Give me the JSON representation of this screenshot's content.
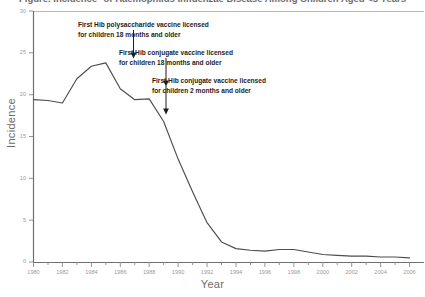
{
  "chart_data": {
    "type": "line",
    "title": "Figure. Incidence* of Haemophilus influenzae Disease Among Children Aged <5 Years",
    "xlabel": "Year",
    "ylabel": "Incidence",
    "xlim": [
      1980,
      2007
    ],
    "ylim": [
      0,
      30
    ],
    "grid": false,
    "legend": "none",
    "xticks": [
      1980,
      1982,
      1984,
      1986,
      1988,
      1990,
      1992,
      1994,
      1996,
      1998,
      2000,
      2002,
      2004,
      2006
    ],
    "xtick_labels": [
      "1980",
      "1982",
      "1984",
      "1986",
      "1988",
      "1990",
      "1992",
      "1994",
      "1996",
      "1998",
      "2000",
      "2002",
      "2004",
      "2006"
    ],
    "yticks": [
      0,
      5,
      10,
      15,
      20,
      25,
      30
    ],
    "ytick_labels": [
      "0",
      "5",
      "10",
      "15",
      "20",
      "25",
      "30"
    ],
    "x": [
      1980,
      1981,
      1982,
      1983,
      1984,
      1985,
      1986,
      1987,
      1988,
      1989,
      1990,
      1991,
      1992,
      1993,
      1994,
      1995,
      1996,
      1997,
      1998,
      1999,
      2000,
      2001,
      2002,
      2003,
      2004,
      2005,
      2006
    ],
    "values": [
      19.4,
      19.3,
      19.0,
      21.9,
      23.4,
      23.8,
      20.7,
      19.4,
      19.5,
      16.8,
      12.3,
      8.4,
      4.7,
      2.4,
      1.6,
      1.4,
      1.3,
      1.5,
      1.5,
      1.2,
      0.9,
      0.8,
      0.7,
      0.7,
      0.6,
      0.6,
      0.5
    ],
    "series_name": "Haemophilus influenzae incidence",
    "annotations": [
      {
        "id": "annotation-1",
        "lines": [
          "First Hib polysaccharide vaccine licensed",
          "for children 18 months and older"
        ],
        "arrow_year": 1985
      },
      {
        "id": "annotation-2",
        "lines": [
          "First Hib conjugate vaccine licensed",
          "for children 18 months and older"
        ],
        "arrow_year": 1987
      },
      {
        "id": "annotation-3",
        "lines": [
          "First Hib conjugate vaccine licensed",
          "for children 2 months and older"
        ],
        "arrow_year": 1989
      }
    ],
    "colors": {
      "line": "#4d4d4d",
      "axis": "#7a7a7a",
      "background": "#ffffff",
      "annotation_text": "#1d1d1d",
      "tick_text": "#9a9a9a",
      "axis_title": "#6b6b6b"
    }
  }
}
